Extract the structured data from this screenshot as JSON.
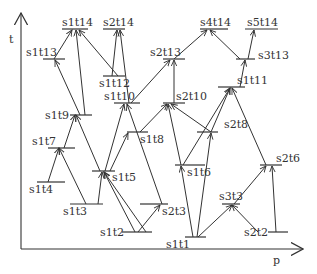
{
  "axes": {
    "y_label": "t",
    "x_label": "p"
  },
  "colors": {
    "stroke": "#333333",
    "background": "#ffffff"
  },
  "nodes": [
    {
      "id": "s1t1",
      "label": "s1t1",
      "x1": 185,
      "x2": 206,
      "y": 237,
      "lx": 166,
      "ly": 248
    },
    {
      "id": "s1t2",
      "label": "s1t2",
      "x1": 122,
      "x2": 152,
      "y": 232,
      "lx": 100,
      "ly": 236
    },
    {
      "id": "s2t2",
      "label": "s2t2",
      "x1": 268,
      "x2": 288,
      "y": 232,
      "lx": 244,
      "ly": 236
    },
    {
      "id": "s1t3",
      "label": "s1t3",
      "x1": 70,
      "x2": 103,
      "y": 204,
      "lx": 63,
      "ly": 215
    },
    {
      "id": "s2t3",
      "label": "s2t3",
      "x1": 140,
      "x2": 168,
      "y": 204,
      "lx": 162,
      "ly": 215
    },
    {
      "id": "s3t3",
      "label": "s3t3",
      "x1": 222,
      "x2": 240,
      "y": 204,
      "lx": 219,
      "ly": 200
    },
    {
      "id": "s1t4",
      "label": "s1t4",
      "x1": 37,
      "x2": 65,
      "y": 182,
      "lx": 29,
      "ly": 193
    },
    {
      "id": "s1t5",
      "label": "s1t5",
      "x1": 92,
      "x2": 115,
      "y": 171,
      "lx": 112,
      "ly": 181
    },
    {
      "id": "s1t6",
      "label": "s1t6",
      "x1": 175,
      "x2": 205,
      "y": 165,
      "lx": 187,
      "ly": 176
    },
    {
      "id": "s2t6",
      "label": "s2t6",
      "x1": 260,
      "x2": 282,
      "y": 165,
      "lx": 276,
      "ly": 162
    },
    {
      "id": "s1t7",
      "label": "s1t7",
      "x1": 48,
      "x2": 75,
      "y": 148,
      "lx": 32,
      "ly": 145
    },
    {
      "id": "s1t8",
      "label": "s1t8",
      "x1": 127,
      "x2": 148,
      "y": 132,
      "lx": 140,
      "ly": 143
    },
    {
      "id": "s2t8",
      "label": "s2t8",
      "x1": 197,
      "x2": 218,
      "y": 132,
      "lx": 224,
      "ly": 128
    },
    {
      "id": "s1t9",
      "label": "s1t9",
      "x1": 70,
      "x2": 92,
      "y": 115,
      "lx": 45,
      "ly": 119
    },
    {
      "id": "s1t10",
      "label": "s1t10",
      "x1": 114,
      "x2": 140,
      "y": 103,
      "lx": 104,
      "ly": 100
    },
    {
      "id": "s2t10",
      "label": "s2t10",
      "x1": 163,
      "x2": 185,
      "y": 103,
      "lx": 176,
      "ly": 100
    },
    {
      "id": "s1t11",
      "label": "s1t11",
      "x1": 218,
      "x2": 245,
      "y": 87,
      "lx": 237,
      "ly": 84
    },
    {
      "id": "s1t12",
      "label": "s1t12",
      "x1": 103,
      "x2": 125,
      "y": 76,
      "lx": 99,
      "ly": 87
    },
    {
      "id": "s1t13",
      "label": "s1t13",
      "x1": 43,
      "x2": 65,
      "y": 59,
      "lx": 26,
      "ly": 56
    },
    {
      "id": "s2t13",
      "label": "s2t13",
      "x1": 163,
      "x2": 185,
      "y": 59,
      "lx": 150,
      "ly": 56
    },
    {
      "id": "s3t13",
      "label": "s3t13",
      "x1": 236,
      "x2": 255,
      "y": 59,
      "lx": 258,
      "ly": 59
    },
    {
      "id": "s1t14",
      "label": "s1t14",
      "x1": 62,
      "x2": 88,
      "y": 29,
      "lx": 62,
      "ly": 26
    },
    {
      "id": "s2t14",
      "label": "s2t14",
      "x1": 103,
      "x2": 125,
      "y": 29,
      "lx": 103,
      "ly": 26
    },
    {
      "id": "s4t14",
      "label": "s4t14",
      "x1": 200,
      "x2": 228,
      "y": 29,
      "lx": 200,
      "ly": 26
    },
    {
      "id": "s5t14",
      "label": "s5t14",
      "x1": 245,
      "x2": 278,
      "y": 29,
      "lx": 247,
      "ly": 26
    }
  ],
  "edges": [
    {
      "from": [
        48,
        182
      ],
      "to": [
        59,
        148
      ]
    },
    {
      "from": [
        86,
        204
      ],
      "to": [
        59,
        148
      ]
    },
    {
      "from": [
        64,
        148
      ],
      "to": [
        75,
        115
      ]
    },
    {
      "from": [
        100,
        171
      ],
      "to": [
        76,
        115
      ]
    },
    {
      "from": [
        98,
        204
      ],
      "to": [
        102,
        172
      ]
    },
    {
      "from": [
        146,
        232
      ],
      "to": [
        104,
        172
      ]
    },
    {
      "from": [
        135,
        232
      ],
      "to": [
        104,
        172
      ]
    },
    {
      "from": [
        138,
        232
      ],
      "to": [
        160,
        205
      ]
    },
    {
      "from": [
        110,
        171
      ],
      "to": [
        128,
        133
      ]
    },
    {
      "from": [
        105,
        171
      ],
      "to": [
        124,
        104
      ]
    },
    {
      "from": [
        162,
        204
      ],
      "to": [
        127,
        104
      ]
    },
    {
      "from": [
        140,
        132
      ],
      "to": [
        167,
        104
      ]
    },
    {
      "from": [
        181,
        165
      ],
      "to": [
        168,
        104
      ]
    },
    {
      "from": [
        211,
        132
      ],
      "to": [
        171,
        104
      ]
    },
    {
      "from": [
        193,
        237
      ],
      "to": [
        181,
        166
      ]
    },
    {
      "from": [
        197,
        237
      ],
      "to": [
        211,
        133
      ]
    },
    {
      "from": [
        198,
        237
      ],
      "to": [
        232,
        205
      ]
    },
    {
      "from": [
        258,
        232
      ],
      "to": [
        232,
        205
      ]
    },
    {
      "from": [
        234,
        204
      ],
      "to": [
        266,
        166
      ]
    },
    {
      "from": [
        276,
        232
      ],
      "to": [
        272,
        166
      ]
    },
    {
      "from": [
        266,
        165
      ],
      "to": [
        232,
        88
      ]
    },
    {
      "from": [
        183,
        165
      ],
      "to": [
        230,
        88
      ]
    },
    {
      "from": [
        211,
        132
      ],
      "to": [
        230,
        88
      ]
    },
    {
      "from": [
        240,
        87
      ],
      "to": [
        245,
        60
      ]
    },
    {
      "from": [
        248,
        59
      ],
      "to": [
        254,
        30
      ]
    },
    {
      "from": [
        240,
        59
      ],
      "to": [
        210,
        30
      ]
    },
    {
      "from": [
        174,
        59
      ],
      "to": [
        207,
        30
      ]
    },
    {
      "from": [
        174,
        103
      ],
      "to": [
        174,
        60
      ]
    },
    {
      "from": [
        131,
        103
      ],
      "to": [
        170,
        60
      ]
    },
    {
      "from": [
        129,
        103
      ],
      "to": [
        120,
        30
      ]
    },
    {
      "from": [
        112,
        76
      ],
      "to": [
        117,
        30
      ]
    },
    {
      "from": [
        118,
        76
      ],
      "to": [
        79,
        30
      ]
    },
    {
      "from": [
        85,
        115
      ],
      "to": [
        76,
        30
      ]
    },
    {
      "from": [
        80,
        115
      ],
      "to": [
        55,
        60
      ]
    },
    {
      "from": [
        54,
        59
      ],
      "to": [
        72,
        30
      ]
    }
  ]
}
